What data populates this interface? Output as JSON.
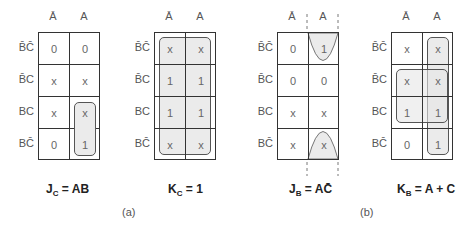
{
  "column_labels": [
    "Ā",
    "A"
  ],
  "row_labels": [
    "B̄C̄",
    "B̄C",
    "BC",
    "BC̄"
  ],
  "maps": [
    {
      "id": "jc",
      "cells": [
        [
          "0",
          "0"
        ],
        [
          "x",
          "x"
        ],
        [
          "x",
          "x"
        ],
        [
          "0",
          "1"
        ]
      ],
      "equation_lhs": "J",
      "equation_sub": "C",
      "equation_rhs": "= AB",
      "groups": [
        "rows 2-3, column A"
      ]
    },
    {
      "id": "kc",
      "cells": [
        [
          "x",
          "x"
        ],
        [
          "1",
          "1"
        ],
        [
          "1",
          "1"
        ],
        [
          "x",
          "x"
        ]
      ],
      "equation_lhs": "K",
      "equation_sub": "C",
      "equation_rhs": "= 1",
      "groups": [
        "all cells"
      ]
    },
    {
      "id": "jb",
      "cells": [
        [
          "0",
          "1"
        ],
        [
          "0",
          "0"
        ],
        [
          "x",
          "x"
        ],
        [
          "x",
          "x"
        ]
      ],
      "equation_lhs": "J",
      "equation_sub": "B",
      "equation_rhs": "= AC̄",
      "groups": [
        "rows 0 and 3 wrap-around, column A"
      ]
    },
    {
      "id": "kb",
      "cells": [
        [
          "x",
          "x"
        ],
        [
          "x",
          "x"
        ],
        [
          "1",
          "1"
        ],
        [
          "0",
          "1"
        ]
      ],
      "equation_lhs": "K",
      "equation_sub": "B",
      "equation_rhs": "= A + C",
      "groups": [
        "column A",
        "rows 1-2"
      ]
    }
  ],
  "captions": {
    "a": "(a)",
    "b": "(b)"
  },
  "colors": {
    "group_fill": "#ebebeb",
    "grid_line": "#333333",
    "text": "#666666"
  }
}
